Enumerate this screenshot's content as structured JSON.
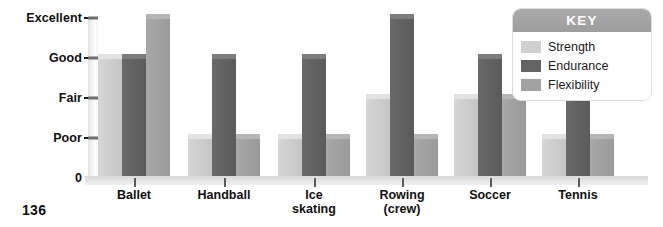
{
  "page_number": "136",
  "legend": {
    "title": "KEY",
    "items": [
      {
        "label": "Strength",
        "color": "#d0d0d0",
        "swatch": "strength-swatch"
      },
      {
        "label": "Endurance",
        "color": "#636363",
        "swatch": "endurance-swatch"
      },
      {
        "label": "Flexibility",
        "color": "#a2a2a2",
        "swatch": "flexibility-swatch"
      }
    ]
  },
  "chart_data": {
    "type": "bar",
    "title": "",
    "xlabel": "",
    "ylabel": "",
    "grid": false,
    "legend_position": "top-right",
    "categories": [
      "Ballet",
      "Handball",
      "Ice\nskating",
      "Rowing\n(crew)",
      "Soccer",
      "Tennis"
    ],
    "ytick_labels": [
      "0",
      "Poor",
      "Fair",
      "Good",
      "Excellent"
    ],
    "ytick_values": [
      0,
      1,
      2,
      3,
      4
    ],
    "ylim": [
      0,
      4
    ],
    "series": [
      {
        "name": "Strength",
        "values": [
          3,
          1,
          1,
          2,
          2,
          1
        ]
      },
      {
        "name": "Endurance",
        "values": [
          3,
          3,
          3,
          4,
          3,
          2
        ]
      },
      {
        "name": "Flexibility",
        "values": [
          4,
          1,
          1,
          1,
          2,
          1
        ]
      }
    ]
  }
}
